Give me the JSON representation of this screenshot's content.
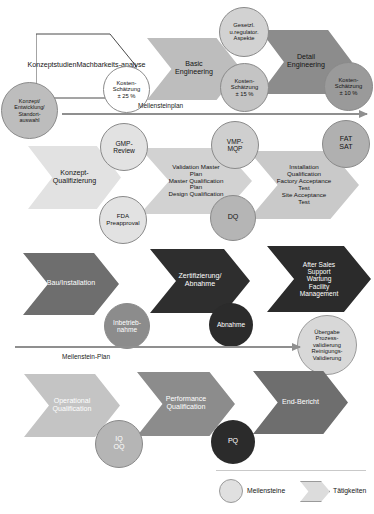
{
  "diagram": {
    "legend": {
      "milestone_label": "Meilensteine",
      "activity_label": "Tätigkeiten"
    },
    "timelines": [
      {
        "label": "Meilensteinplan"
      },
      {
        "label": "Meilenstein-Plan"
      }
    ]
  },
  "block_a": {
    "activities": [
      {
        "name": "konzeptstudien",
        "line1": "Konzeptstudien",
        "line2": "Machbarkeits-",
        "line3": "analyse",
        "fill": "#ffffff"
      },
      {
        "name": "basic-engineering",
        "line1": "Basic",
        "line2": "Engineering",
        "fill": "#bdbdbd"
      },
      {
        "name": "detail-engineering",
        "line1": "Detail",
        "line2": "Engineering",
        "fill": "#8c8c8c"
      }
    ],
    "milestones": [
      {
        "name": "konzept-entwicklung-standortauswahl",
        "line1": "Konzept/",
        "line2": "Entwicklung/",
        "line3": "Standort-",
        "line4": "auswahl",
        "fill": "#bdbdbd"
      },
      {
        "name": "kostenschaetzung-25",
        "line1": "Kosten-",
        "line2": "Schätzung",
        "line3": "± 25 %",
        "fill": "#ffffff"
      },
      {
        "name": "gesetzl-regulator-aspekte",
        "line1": "Gesetzl.",
        "line2": "u.regulator.",
        "line3": "Aspekte",
        "fill": "#d2d2d2"
      },
      {
        "name": "kostenschaetzung-15",
        "line1": "Kosten-",
        "line2": "Schätzung",
        "line3": "± 15 %",
        "fill": "#c4c4c4"
      },
      {
        "name": "kostenschaetzung-10",
        "line1": "Kosten-",
        "line2": "Schätzung",
        "line3": "± 10 %",
        "fill": "#9a9a9a"
      }
    ]
  },
  "block_b": {
    "activities": [
      {
        "name": "konzept-qualifizierung",
        "line1": "Konzept-",
        "line2": "Qualifizierung",
        "fill": "#e2e2e2"
      },
      {
        "name": "validation-master-plan",
        "line1": "Validation Master",
        "line2": "Plan",
        "line3": "Master Qualification",
        "line4": "Plan",
        "line5": "Design Qualification",
        "fill": "#d2d2d2"
      },
      {
        "name": "installation-qualification",
        "line1": "Installation",
        "line2": "Qualification",
        "line3": "Factory Acceptance",
        "line4": "Test",
        "line5": "Site Acceptance",
        "line6": "Test",
        "fill": "#c9c9c9"
      }
    ],
    "milestones": [
      {
        "name": "gmp-review",
        "line1": "GMP-",
        "line2": "Review",
        "fill": "#e2e2e2"
      },
      {
        "name": "fda-preapproval",
        "line1": "FDA",
        "line2": "Preapproval",
        "fill": "#e2e2e2"
      },
      {
        "name": "vmp-mqp",
        "line1": "VMP-",
        "line2": "MQP",
        "fill": "#cfcfcf"
      },
      {
        "name": "dq",
        "line1": "DQ",
        "fill": "#b5b5b5"
      },
      {
        "name": "fat-sat",
        "line1": "FAT",
        "line2": "SAT",
        "fill": "#b0b0b0"
      }
    ]
  },
  "block_c": {
    "activities": [
      {
        "name": "bau-installation",
        "line1": "Bau/Installation",
        "fill": "#6e6e6e"
      },
      {
        "name": "zertifizierung-abnahme",
        "line1": "Zertifizierung/",
        "line2": "Abnahme",
        "fill": "#2e2e2e"
      },
      {
        "name": "after-sales-support",
        "line1": "After Sales",
        "line2": "Support",
        "line3": "Wartung",
        "line4": "Facility",
        "line5": "Management",
        "fill": "#2b2b2b"
      }
    ],
    "milestones": [
      {
        "name": "inbetriebnahme",
        "line1": "Inbetrieb-",
        "line2": "nahme",
        "fill": "#8c8c8c"
      },
      {
        "name": "abnahme",
        "line1": "Abnahme",
        "fill": "#2b2b2b"
      },
      {
        "name": "uebergabe-prozessvalidierung",
        "line1": "Übergabe",
        "line2": "Prozess-",
        "line3": "validierung",
        "line4": "Reinigungs-",
        "line5": "Validierung",
        "fill": "#d8d8d8"
      }
    ]
  },
  "block_d": {
    "activities": [
      {
        "name": "operational-qualification",
        "line1": "Operational",
        "line2": "Qualification",
        "fill": "#c4c4c4"
      },
      {
        "name": "performance-qualification",
        "line1": "Performance",
        "line2": "Qualification",
        "fill": "#8c8c8c"
      },
      {
        "name": "end-bericht",
        "line1": "End-Bericht",
        "fill": "#6e6e6e"
      }
    ],
    "milestones": [
      {
        "name": "iq-oq",
        "line1": "IQ",
        "line2": "OQ",
        "fill": "#b5b5b5"
      },
      {
        "name": "pq",
        "line1": "PQ",
        "fill": "#2b2b2b"
      }
    ]
  }
}
